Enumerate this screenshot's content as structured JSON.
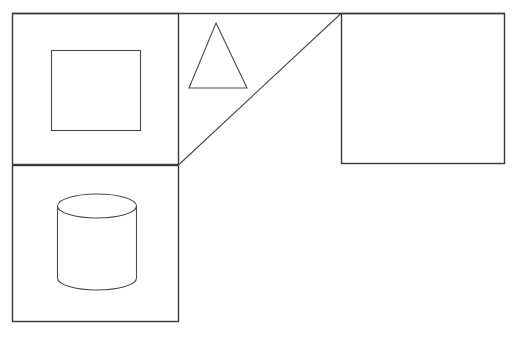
{
  "scene": {
    "title": "Geometric line drawing",
    "background_color": "#ffffff",
    "stroke_color": "#3a3a3a",
    "width": 515,
    "height": 338
  },
  "shapes": {
    "upper_left_panel": {
      "name": "upper-left rectangle",
      "x": 12,
      "y": 13,
      "width": 167,
      "height": 152,
      "stroke": "#3a3a3a"
    },
    "inner_square": {
      "name": "inner square",
      "x": 51,
      "y": 50,
      "width": 90,
      "height": 81,
      "stroke": "#4a4a4a"
    },
    "lower_left_panel": {
      "name": "lower-left rectangle",
      "x": 12,
      "y": 165,
      "width": 167,
      "height": 157,
      "stroke": "#3a3a3a"
    },
    "cylinder": {
      "name": "cylinder",
      "left": 57,
      "right": 136,
      "top_ellipse_cy": 206,
      "ellipse_rx": 39.5,
      "ellipse_ry": 12,
      "body_bottom": 278,
      "stroke": "#4a4a4a"
    },
    "triangle": {
      "name": "triangle",
      "apex_x": 216,
      "apex_y": 23,
      "base_left_x": 189,
      "base_right_x": 247,
      "base_y": 88,
      "stroke": "#4a4a4a"
    },
    "diagonal_line": {
      "name": "diagonal line",
      "x1": 178,
      "y1": 165,
      "x2": 341,
      "y2": 13,
      "stroke": "#4a4a4a"
    },
    "top_edge": {
      "name": "top horizontal edge",
      "x1": 12,
      "y1": 13,
      "x2": 505,
      "y2": 13
    },
    "right_panel": {
      "name": "right rectangle",
      "x": 341,
      "y": 13,
      "width": 164,
      "height": 151,
      "stroke": "#3a3a3a"
    }
  }
}
